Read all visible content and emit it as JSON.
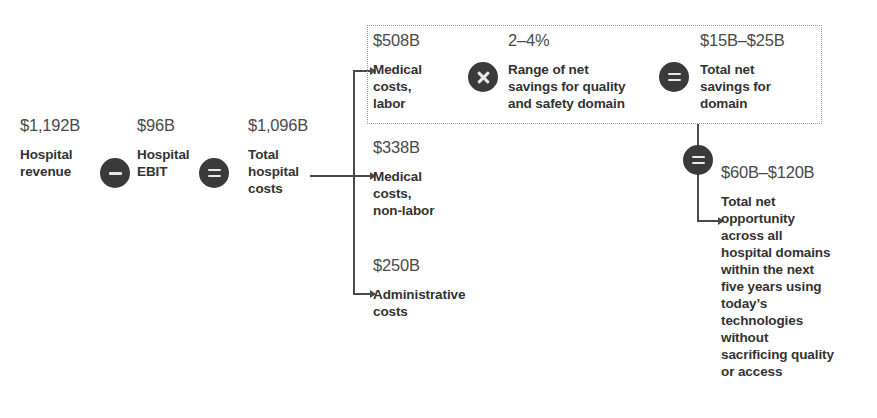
{
  "diagram": {
    "colors": {
      "operator_circle": "#3a3a3a",
      "operator_glyph": "#e8e8e8",
      "amount_text": "#4a4a4a",
      "label_text": "#333333",
      "connector": "#4a4a4a",
      "dotted_border": "#9a9a9a",
      "background": "#ffffff"
    },
    "left_chain": {
      "nodes": [
        {
          "amount": "$1,192B",
          "label": "Hospital\nrevenue"
        },
        {
          "amount": "$96B",
          "label": "Hospital\nEBIT"
        },
        {
          "amount": "$1,096B",
          "label": "Total\nhospital\ncosts"
        }
      ],
      "operators": [
        {
          "symbol": "minus",
          "name": "minus-operator"
        },
        {
          "symbol": "equals",
          "name": "equals-operator"
        }
      ]
    },
    "cost_breakdown": {
      "items": [
        {
          "amount": "$508B",
          "label": "Medical\ncosts,\nlabor"
        },
        {
          "amount": "$338B",
          "label": "Medical\ncosts,\nnon-labor"
        },
        {
          "amount": "$250B",
          "label": "Administrative\ncosts"
        }
      ]
    },
    "domain_box": {
      "multiplier": {
        "amount": "2–4%",
        "label": "Range of net\nsavings for quality\nand safety domain"
      },
      "result": {
        "amount": "$15B–$25B",
        "label": "Total net\nsavings for\ndomain"
      },
      "operators": [
        {
          "symbol": "times",
          "name": "multiply-operator"
        },
        {
          "symbol": "equals",
          "name": "equals-operator"
        }
      ]
    },
    "total_opportunity": {
      "operator": {
        "symbol": "equals",
        "name": "equals-operator"
      },
      "amount": "$60B–$120B",
      "label": "Total net\nopportunity\nacross all\nhospital domains\nwithin the next\nfive years using\ntoday’s\ntechnologies\nwithout\nsacrificing quality\nor access"
    }
  }
}
